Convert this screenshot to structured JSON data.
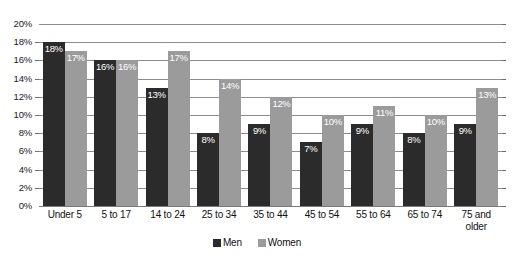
{
  "chart_data": {
    "type": "bar",
    "title": "",
    "subtitle": "",
    "xlabel": "",
    "ylabel": "",
    "ylim": [
      0,
      20
    ],
    "ytick_step": 2,
    "grid": true,
    "legend_position": "bottom",
    "value_suffix": "%",
    "categories": [
      "Under 5",
      "5 to 17",
      "14 to 24",
      "25 to 34",
      "35 to 44",
      "45 to 54",
      "55 to 64",
      "65 to 74",
      "75 and older"
    ],
    "ytick_labels": [
      "0%",
      "2%",
      "4%",
      "6%",
      "8%",
      "10%",
      "12%",
      "14%",
      "16%",
      "18%",
      "20%"
    ],
    "series": [
      {
        "name": "Men",
        "color": "#2b2b2b",
        "values": [
          18,
          16,
          13,
          8,
          9,
          7,
          9,
          8,
          9
        ],
        "labels": [
          "18%",
          "16%",
          "13%",
          "8%",
          "9%",
          "7%",
          "9%",
          "8%",
          "9%"
        ]
      },
      {
        "name": "Women",
        "color": "#9b9b9b",
        "values": [
          17,
          16,
          17,
          14,
          12,
          10,
          11,
          10,
          13
        ],
        "labels": [
          "17%",
          "16%",
          "17%",
          "14%",
          "12%",
          "10%",
          "11%",
          "10%",
          "13%"
        ]
      }
    ]
  }
}
